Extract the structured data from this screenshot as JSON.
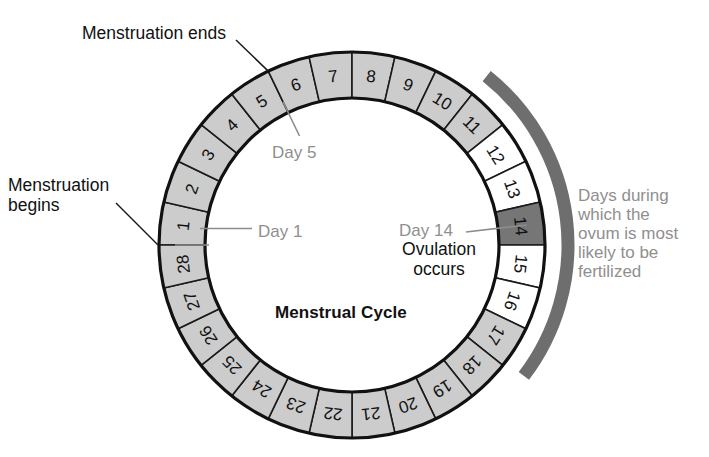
{
  "diagram": {
    "title": "Menstrual Cycle",
    "center_label": "Menstrual Cycle",
    "cycle_length_days": 28
  },
  "annotations": {
    "menstruation_ends": "Menstruation ends",
    "menstruation_begins": "Menstruation\nbegins",
    "day1": "Day 1",
    "day5": "Day 5",
    "day14": "Day 14",
    "ovulation": "Ovulation\noccurs",
    "fertilization_window": "Days during\nwhich the\novum is most\nlikely to be\nfertilized"
  },
  "colors": {
    "shaded_segment": "#cccccc",
    "plain_segment": "#ffffff",
    "ovulation_segment": "#767676",
    "fertile_arc": "#6e6e6e",
    "outline": "#111111",
    "gray_text": "#8f8f8f",
    "black_text": "#111111"
  },
  "chart_data": {
    "type": "pie",
    "title": "Menstrual Cycle",
    "xlabel": "",
    "ylabel": "",
    "legend_position": "right",
    "categories": [
      "1",
      "2",
      "3",
      "4",
      "5",
      "6",
      "7",
      "8",
      "9",
      "10",
      "11",
      "12",
      "13",
      "14",
      "15",
      "16",
      "17",
      "18",
      "19",
      "20",
      "21",
      "22",
      "23",
      "24",
      "25",
      "26",
      "27",
      "28"
    ],
    "values": [
      1,
      1,
      1,
      1,
      1,
      1,
      1,
      1,
      1,
      1,
      1,
      1,
      1,
      1,
      1,
      1,
      1,
      1,
      1,
      1,
      1,
      1,
      1,
      1,
      1,
      1,
      1,
      1
    ],
    "segments": [
      {
        "day": 1,
        "label": "1",
        "state": "shaded"
      },
      {
        "day": 2,
        "label": "2",
        "state": "shaded"
      },
      {
        "day": 3,
        "label": "3",
        "state": "shaded"
      },
      {
        "day": 4,
        "label": "4",
        "state": "shaded"
      },
      {
        "day": 5,
        "label": "5",
        "state": "shaded"
      },
      {
        "day": 6,
        "label": "6",
        "state": "shaded"
      },
      {
        "day": 7,
        "label": "7",
        "state": "shaded"
      },
      {
        "day": 8,
        "label": "8",
        "state": "shaded"
      },
      {
        "day": 9,
        "label": "9",
        "state": "shaded"
      },
      {
        "day": 10,
        "label": "10",
        "state": "shaded"
      },
      {
        "day": 11,
        "label": "11",
        "state": "shaded"
      },
      {
        "day": 12,
        "label": "12",
        "state": "plain"
      },
      {
        "day": 13,
        "label": "13",
        "state": "plain"
      },
      {
        "day": 14,
        "label": "14",
        "state": "ovulation"
      },
      {
        "day": 15,
        "label": "15",
        "state": "plain"
      },
      {
        "day": 16,
        "label": "16",
        "state": "plain"
      },
      {
        "day": 17,
        "label": "17",
        "state": "shaded"
      },
      {
        "day": 18,
        "label": "18",
        "state": "shaded"
      },
      {
        "day": 19,
        "label": "19",
        "state": "shaded"
      },
      {
        "day": 20,
        "label": "20",
        "state": "shaded"
      },
      {
        "day": 21,
        "label": "21",
        "state": "shaded"
      },
      {
        "day": 22,
        "label": "22",
        "state": "shaded"
      },
      {
        "day": 23,
        "label": "23",
        "state": "shaded"
      },
      {
        "day": 24,
        "label": "24",
        "state": "shaded"
      },
      {
        "day": 25,
        "label": "25",
        "state": "shaded"
      },
      {
        "day": 26,
        "label": "26",
        "state": "shaded"
      },
      {
        "day": 27,
        "label": "27",
        "state": "shaded"
      },
      {
        "day": 28,
        "label": "28",
        "state": "shaded"
      }
    ],
    "fertile_window": {
      "start_day": 11,
      "end_day": 17,
      "label": "Days during which the ovum is most likely to be fertilized"
    },
    "ovulation_day": 14,
    "menstruation_start_day": 1,
    "menstruation_end_day": 5
  },
  "geometry": {
    "center_x": 352,
    "center_y": 245,
    "outer_radius": 193,
    "inner_radius": 147,
    "arc_radius": 216,
    "start_angle_deg": 180,
    "direction": "clockwise"
  }
}
